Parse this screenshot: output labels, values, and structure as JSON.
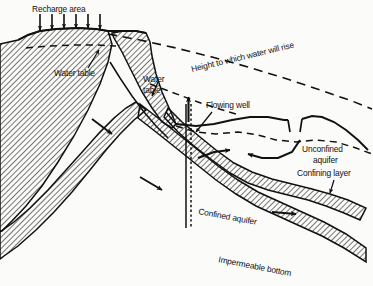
{
  "figure": {
    "type": "cross-section-diagram",
    "background_color": "#fbfbfa",
    "ink_color": "#111111"
  },
  "labels": {
    "recharge_area": "Recharge area",
    "water_table_left": "Water table",
    "water_table_mid_line1": "Water",
    "water_table_mid_line2": "table",
    "height_to_which_water_will_rise": "Height to which water will rise",
    "flowing_well": "Flowing well",
    "unconfined_aquifer_line1": "Unconfined",
    "unconfined_aquifer_line2": "aquifer",
    "confining_layer": "Confining layer",
    "confined_aquifer": "Confined aquifer",
    "impermeable_bottom": "Impermeable bottom"
  },
  "features": {
    "recharge_arrow_count": 6,
    "recharge_arrow_direction": "down",
    "well_arrow_direction": "up",
    "confined_flow_arrow_count": 2,
    "confined_flow_direction": "down-right",
    "unconfined_flow_arrow_count": 2,
    "water_table_line_style": "dashed",
    "potentiometric_line_style": "dashed",
    "hatch_angle_degrees": 45
  },
  "icons": {
    "recharge_arrow": "arrow-down-icon",
    "well_discharge_arrow": "arrow-up-icon",
    "flow_arrow": "arrow-flow-icon",
    "leader_arrow": "leader-arrow-icon"
  }
}
